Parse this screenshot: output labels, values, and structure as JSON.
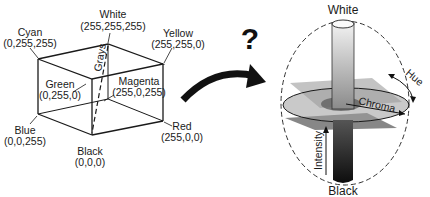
{
  "rgb_cube": {
    "vertices": {
      "white": {
        "name": "White",
        "value": "(255,255,255)"
      },
      "cyan": {
        "name": "Cyan",
        "value": "(0,255,255)"
      },
      "yellow": {
        "name": "Yellow",
        "value": "(255,255,0)"
      },
      "green": {
        "name": "Green",
        "value": "(0,255,0)"
      },
      "magenta": {
        "name": "Magenta",
        "value": "(255,0,255)"
      },
      "blue": {
        "name": "Blue",
        "value": "(0,0,255)"
      },
      "red": {
        "name": "Red",
        "value": "(255,0,0)"
      },
      "black": {
        "name": "Black",
        "value": "(0,0,0)"
      }
    },
    "diagonal_label": "Grays"
  },
  "transition": {
    "question_mark": "?",
    "arrow_icon": "curved-arrow-right"
  },
  "hsi_model": {
    "top_label": "White",
    "bottom_label": "Black",
    "axis_label": "Intensity",
    "radial_label": "Chroma",
    "angular_label": "Hue"
  },
  "colors": {
    "line": "#1a1a1a",
    "plane_light": "#bdbdbd",
    "plane_dark": "#7a7a7a",
    "disc": "#9c9c9c"
  }
}
